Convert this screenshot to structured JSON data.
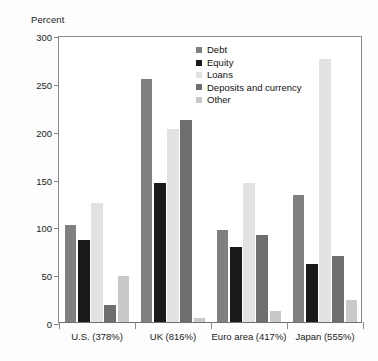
{
  "chart_data": {
    "type": "bar",
    "title": "",
    "xlabel": "",
    "ylabel": "Percent",
    "ylim": [
      0,
      300
    ],
    "yticks": [
      0,
      50,
      100,
      150,
      200,
      250,
      300
    ],
    "grid": false,
    "legend_position": "inside-top-center",
    "categories": [
      "U.S. (378%)",
      "UK (816%)",
      "Euro area (417%)",
      "Japan (555%)"
    ],
    "series": [
      {
        "name": "Debt",
        "color": "#808080",
        "values": [
          101,
          254,
          96,
          133
        ]
      },
      {
        "name": "Equity",
        "color": "#1a1a1a",
        "values": [
          86,
          145,
          78,
          61
        ]
      },
      {
        "name": "Loans",
        "color": "#e2e2e2",
        "values": [
          124,
          202,
          145,
          275
        ]
      },
      {
        "name": "Deposits and currency",
        "color": "#6e6e6e",
        "values": [
          18,
          211,
          91,
          69
        ]
      },
      {
        "name": "Other",
        "color": "#c9c9c9",
        "values": [
          48,
          4,
          12,
          23
        ]
      }
    ]
  },
  "axis": {
    "y_title": "Percent",
    "tick_labels": [
      "300",
      "250",
      "200",
      "150",
      "100",
      "50",
      "0"
    ]
  },
  "legend": {
    "items": [
      {
        "label": "Debt"
      },
      {
        "label": "Equity"
      },
      {
        "label": "Loans"
      },
      {
        "label": "Deposits and currency"
      },
      {
        "label": "Other"
      }
    ]
  }
}
